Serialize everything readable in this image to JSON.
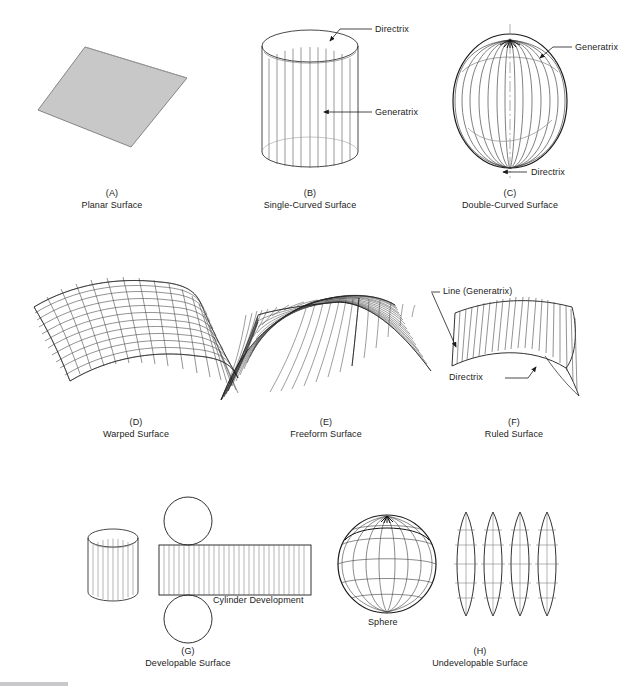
{
  "figure": {
    "title_faint_top": "",
    "background_color": "#ffffff",
    "line_color": "#1b1b1b",
    "planar_fill_color": "#c8c8c8",
    "bottom_bar_color": "#c9c9cb"
  },
  "panels": [
    {
      "id": "(A)",
      "label": "Planar Surface",
      "annotations": []
    },
    {
      "id": "(B)",
      "label": "Single-Curved Surface",
      "annotations": [
        "Directrix",
        "Generatrix"
      ]
    },
    {
      "id": "(C)",
      "label": "Double-Curved Surface",
      "annotations": [
        "Generatrix",
        "Directrix"
      ]
    },
    {
      "id": "(D)",
      "label": "Warped Surface",
      "annotations": []
    },
    {
      "id": "(E)",
      "label": "Freeform Surface",
      "annotations": []
    },
    {
      "id": "(F)",
      "label": "Ruled Surface",
      "annotations": [
        "Line (Generatrix)",
        "Directrix"
      ]
    },
    {
      "id": "(G)",
      "label": "Developable Surface",
      "annotations": [
        "Cylinder Development"
      ]
    },
    {
      "id": "(H)",
      "label": "Undevelopable Surface",
      "annotations": [
        "Sphere"
      ]
    }
  ],
  "labels": {
    "b_directrix": "Directrix",
    "b_generatrix": "Generatrix",
    "c_generatrix": "Generatrix",
    "c_directrix": "Directrix",
    "f_line_generatrix": "Line (Generatrix)",
    "f_directrix": "Directrix",
    "g_cylinder_development": "Cylinder Development",
    "h_sphere": "Sphere"
  },
  "captions": {
    "a_id": "(A)",
    "a_label": "Planar Surface",
    "b_id": "(B)",
    "b_label": "Single-Curved Surface",
    "c_id": "(C)",
    "c_label": "Double-Curved Surface",
    "d_id": "(D)",
    "d_label": "Warped Surface",
    "e_id": "(E)",
    "e_label": "Freeform Surface",
    "f_id": "(F)",
    "f_label": "Ruled Surface",
    "g_id": "(G)",
    "g_label": "Developable Surface",
    "h_id": "(H)",
    "h_label": "Undevelopable Surface"
  }
}
